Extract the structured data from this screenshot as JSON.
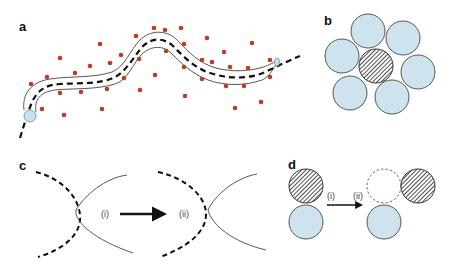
{
  "figure": {
    "panels": {
      "a": {
        "label": "a",
        "description": "tube around dashed trajectory with scattered particles",
        "colors": {
          "particle": "#c0392b",
          "tube_stroke": "#444444",
          "end_cap": "#c9e0ef",
          "trajectory": "#111111"
        }
      },
      "b": {
        "label": "b",
        "description": "hatched central sphere surrounded by six light-blue spheres",
        "colors": {
          "sphere_fill": "#cfe3ef",
          "sphere_stroke": "#444444",
          "hatch": "#222222"
        }
      },
      "c": {
        "label": "c",
        "step_i": "(i)",
        "step_ii": "(ii)",
        "description": "dashed curve crossing solid curve, then separated after step"
      },
      "d": {
        "label": "d",
        "step_i": "(i)",
        "step_ii": "(ii)",
        "description": "hatched sphere moves from above blue sphere to adjacent position, leaving dashed vacancy"
      }
    }
  }
}
